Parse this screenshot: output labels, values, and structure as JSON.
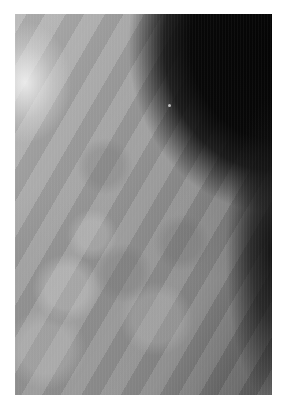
{
  "image": {
    "description": "Grayscale mammogram crop showing breast tissue with dark background at upper right",
    "colors": {
      "page_background": "#ffffff",
      "tissue_light": "#b8b8b8",
      "tissue_mid": "#8a8a8a",
      "background_dark": "#050505"
    }
  }
}
